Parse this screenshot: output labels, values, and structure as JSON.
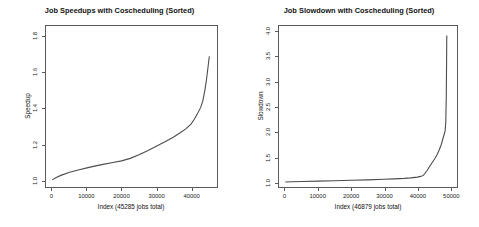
{
  "figure": {
    "background": "#ffffff",
    "line_color": "#4d4d4d",
    "axis_color": "#5a5a5a"
  },
  "panels": [
    {
      "title": "Job Speedups with Coscheduling (Sorted)",
      "xlabel": "Index (45285 jobs total)",
      "ylabel": "Speedup",
      "xticks": [
        "0",
        "10000",
        "20000",
        "30000",
        "40000"
      ],
      "yticks": [
        "1.0",
        "1.2",
        "1.4",
        "1.6",
        "1.8"
      ]
    },
    {
      "title": "Job Slowdown with Coscheduling (Sorted)",
      "xlabel": "Index (46879 jobs total)",
      "ylabel": "Slowdown",
      "xticks": [
        "0",
        "10000",
        "20000",
        "30000",
        "40000",
        "50000"
      ],
      "yticks": [
        "1.0",
        "1.5",
        "2.0",
        "2.5",
        "3.0",
        "3.5",
        "4.0"
      ]
    }
  ],
  "chart_data": [
    {
      "type": "line",
      "title": "Job Speedups with Coscheduling (Sorted)",
      "xlabel": "Index (45285 jobs total)",
      "ylabel": "Speedup",
      "xlim": [
        -1800,
        47500
      ],
      "ylim": [
        0.96,
        1.86
      ],
      "xticks": [
        0,
        10000,
        20000,
        30000,
        40000
      ],
      "yticks": [
        1.0,
        1.2,
        1.4,
        1.6,
        1.8
      ],
      "grid": false,
      "legend": "none",
      "total_jobs": 45285,
      "series": [
        {
          "name": "Speedup (sorted ascending)",
          "x": [
            0,
            1000,
            2500,
            5000,
            7500,
            10000,
            12500,
            15000,
            17500,
            20000,
            22500,
            25000,
            27500,
            30000,
            32500,
            35000,
            37000,
            38500,
            40000,
            41000,
            42000,
            42800,
            43400,
            44000,
            44500,
            45000,
            45285
          ],
          "y": [
            1.0,
            1.012,
            1.025,
            1.042,
            1.055,
            1.067,
            1.078,
            1.088,
            1.097,
            1.106,
            1.12,
            1.14,
            1.163,
            1.188,
            1.213,
            1.24,
            1.265,
            1.285,
            1.312,
            1.34,
            1.375,
            1.405,
            1.44,
            1.5,
            1.565,
            1.645,
            1.69
          ]
        }
      ]
    },
    {
      "type": "line",
      "title": "Job Slowdown with Coscheduling (Sorted)",
      "xlabel": "Index (46879 jobs total)",
      "ylabel": "Slowdown",
      "xlim": [
        -1900,
        52000
      ],
      "ylim": [
        0.9,
        4.12
      ],
      "xticks": [
        0,
        10000,
        20000,
        30000,
        40000,
        50000
      ],
      "yticks": [
        1.0,
        1.5,
        2.0,
        2.5,
        3.0,
        3.5,
        4.0
      ],
      "grid": false,
      "legend": "none",
      "total_jobs": 46879,
      "series": [
        {
          "name": "Slowdown (sorted ascending)",
          "x": [
            0,
            2000,
            5000,
            10000,
            15000,
            20000,
            25000,
            30000,
            33000,
            36000,
            38000,
            40000,
            41000,
            41800,
            42200,
            42600,
            43000,
            43600,
            44400,
            45200,
            46000,
            46600,
            47200,
            47700,
            48100,
            48400,
            48600,
            48750,
            48850,
            48900
          ],
          "y": [
            1.0,
            1.005,
            1.01,
            1.018,
            1.026,
            1.034,
            1.043,
            1.055,
            1.062,
            1.072,
            1.082,
            1.098,
            1.112,
            1.132,
            1.165,
            1.2,
            1.235,
            1.3,
            1.38,
            1.46,
            1.55,
            1.64,
            1.74,
            1.86,
            1.95,
            2.02,
            2.2,
            2.7,
            3.4,
            3.93
          ]
        }
      ]
    }
  ]
}
